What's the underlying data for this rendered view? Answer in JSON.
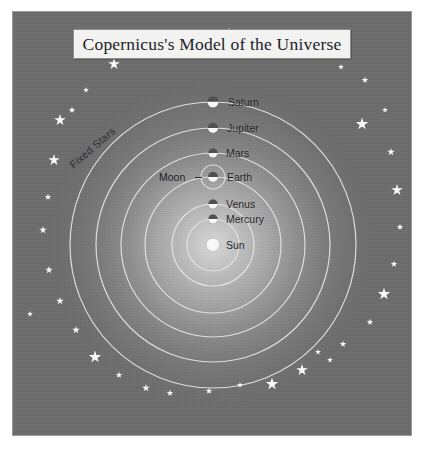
{
  "figure": {
    "title": "Copernicus's Model of the Universe",
    "background_color": "#6f6f6f",
    "glow_color": "#d9d9d9",
    "orbit_line_color": "#e8e8e6",
    "star_color": "#fdfdfb",
    "label_color": "#1c1c22",
    "fixed_stars_label": "Fixed Stars",
    "moon_label": "Moon"
  },
  "center": {
    "x": 200,
    "y": 233
  },
  "chart_data": {
    "type": "diagram",
    "title": "Copernicus's Model of the Universe",
    "model": "heliocentric",
    "center_body": "Sun",
    "annotations": [
      "Fixed Stars",
      "Moon"
    ],
    "bodies": [
      {
        "name": "Sun",
        "orbit_radius": 0,
        "dot_size": 15,
        "label_dx": 13,
        "label_dy": 0
      },
      {
        "name": "Mercury",
        "orbit_radius": 26,
        "dot_size": 9,
        "label_dx": 13,
        "label_dy": 0
      },
      {
        "name": "Venus",
        "orbit_radius": 41,
        "dot_size": 9,
        "label_dx": 13,
        "label_dy": 0
      },
      {
        "name": "Earth",
        "orbit_radius": 68,
        "dot_size": 10,
        "label_dx": 14,
        "label_dy": 0
      },
      {
        "name": "Mars",
        "orbit_radius": 92,
        "dot_size": 9,
        "label_dx": 13,
        "label_dy": 0
      },
      {
        "name": "Jupiter",
        "orbit_radius": 117,
        "dot_size": 10,
        "label_dx": 14,
        "label_dy": 0
      },
      {
        "name": "Saturn",
        "orbit_radius": 143,
        "dot_size": 11,
        "label_dx": 15,
        "label_dy": 0
      }
    ],
    "moon_orbit_radius": 12,
    "orbit_radii": [
      26,
      41,
      68,
      92,
      117,
      143
    ],
    "stars": [
      {
        "x": 216,
        "y": 22,
        "size": 13
      },
      {
        "x": 172,
        "y": 28,
        "size": 7
      },
      {
        "x": 258,
        "y": 32,
        "size": 8
      },
      {
        "x": 123,
        "y": 41,
        "size": 8
      },
      {
        "x": 298,
        "y": 42,
        "size": 7
      },
      {
        "x": 101,
        "y": 52,
        "size": 12
      },
      {
        "x": 328,
        "y": 55,
        "size": 6
      },
      {
        "x": 73,
        "y": 78,
        "size": 6
      },
      {
        "x": 352,
        "y": 68,
        "size": 7
      },
      {
        "x": 59,
        "y": 98,
        "size": 7
      },
      {
        "x": 372,
        "y": 98,
        "size": 6
      },
      {
        "x": 47,
        "y": 108,
        "size": 12
      },
      {
        "x": 349,
        "y": 112,
        "size": 13
      },
      {
        "x": 41,
        "y": 148,
        "size": 12
      },
      {
        "x": 378,
        "y": 140,
        "size": 8
      },
      {
        "x": 35,
        "y": 185,
        "size": 7
      },
      {
        "x": 384,
        "y": 178,
        "size": 12
      },
      {
        "x": 30,
        "y": 218,
        "size": 8
      },
      {
        "x": 387,
        "y": 215,
        "size": 7
      },
      {
        "x": 36,
        "y": 258,
        "size": 8
      },
      {
        "x": 381,
        "y": 252,
        "size": 7
      },
      {
        "x": 47,
        "y": 289,
        "size": 8
      },
      {
        "x": 371,
        "y": 282,
        "size": 13
      },
      {
        "x": 63,
        "y": 318,
        "size": 8
      },
      {
        "x": 357,
        "y": 310,
        "size": 7
      },
      {
        "x": 82,
        "y": 345,
        "size": 13
      },
      {
        "x": 330,
        "y": 332,
        "size": 7
      },
      {
        "x": 106,
        "y": 363,
        "size": 7
      },
      {
        "x": 317,
        "y": 348,
        "size": 6
      },
      {
        "x": 133,
        "y": 376,
        "size": 8
      },
      {
        "x": 289,
        "y": 358,
        "size": 12
      },
      {
        "x": 157,
        "y": 381,
        "size": 7
      },
      {
        "x": 259,
        "y": 372,
        "size": 13
      },
      {
        "x": 196,
        "y": 379,
        "size": 7
      },
      {
        "x": 227,
        "y": 373,
        "size": 6
      },
      {
        "x": 305,
        "y": 340,
        "size": 6
      },
      {
        "x": 17,
        "y": 302,
        "size": 6
      }
    ]
  }
}
